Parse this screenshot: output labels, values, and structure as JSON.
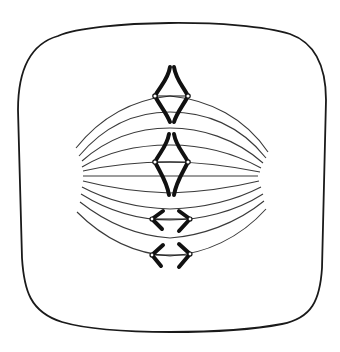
{
  "figure": {
    "title": "Cell in metaphase with spindle fibers and chromosomes",
    "colors": {
      "background": "#ffffff",
      "ink": "#1a1a1a",
      "fiber": "#3a3a3a"
    },
    "cell": {
      "shape": "rounded-square",
      "label": "cell membrane"
    },
    "poles": [
      {
        "name": "left-pole",
        "x": 78,
        "y": 176
      },
      {
        "name": "right-pole",
        "x": 262,
        "y": 176
      }
    ],
    "spindle_fiber_count": 11,
    "chromosomes": [
      {
        "name": "chromosome-1",
        "type": "diamond",
        "kinetochores": [
          [
            155,
            96
          ],
          [
            188,
            96
          ]
        ]
      },
      {
        "name": "chromosome-2",
        "type": "diamond",
        "kinetochores": [
          [
            155,
            162
          ],
          [
            188,
            162
          ]
        ]
      },
      {
        "name": "chromosome-3",
        "type": "chevron-pair",
        "kinetochores": [
          [
            152,
            220
          ],
          [
            190,
            220
          ]
        ]
      },
      {
        "name": "chromosome-4",
        "type": "chevron-pair",
        "kinetochores": [
          [
            152,
            256
          ],
          [
            190,
            256
          ]
        ]
      }
    ]
  }
}
